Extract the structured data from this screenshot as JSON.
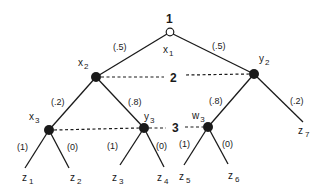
{
  "colors": {
    "ink": "#1a1a1a",
    "background": "#ffffff"
  },
  "players": {
    "p1": "1",
    "p2": "2",
    "p3": "3"
  },
  "nodes": {
    "x1": {
      "base": "x",
      "sub": "1",
      "type": "chance-open"
    },
    "x2": {
      "base": "x",
      "sub": "2",
      "type": "decision"
    },
    "y2": {
      "base": "y",
      "sub": "2",
      "type": "decision"
    },
    "x3": {
      "base": "x",
      "sub": "3",
      "type": "decision"
    },
    "y3": {
      "base": "y",
      "sub": "3",
      "type": "decision"
    },
    "w3": {
      "base": "w",
      "sub": "3",
      "type": "decision"
    }
  },
  "leaves": [
    {
      "base": "z",
      "sub": "1"
    },
    {
      "base": "z",
      "sub": "2"
    },
    {
      "base": "z",
      "sub": "3"
    },
    {
      "base": "z",
      "sub": "4"
    },
    {
      "base": "z",
      "sub": "5"
    },
    {
      "base": "z",
      "sub": "6"
    },
    {
      "base": "z",
      "sub": "7"
    }
  ],
  "probabilities": {
    "x1_left": "(.5)",
    "x1_right": "(.5)",
    "x2_left": "(.2)",
    "x2_right": "(.8)",
    "y2_left": "(.8)",
    "y2_right": "(.2)",
    "x3_left": "(1)",
    "x3_right": "(0)",
    "y3_left": "(1)",
    "y3_right": "(0)",
    "w3_left": "(1)",
    "w3_right": "(0)"
  },
  "information_sets": [
    {
      "player": "2",
      "members": [
        "x2",
        "y2"
      ]
    },
    {
      "player": "3",
      "members": [
        "x3",
        "y3",
        "w3"
      ]
    }
  ]
}
